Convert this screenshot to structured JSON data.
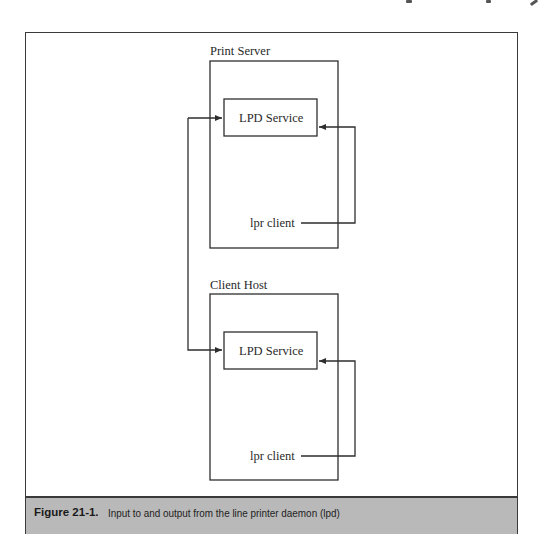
{
  "figure": {
    "number_label": "Figure 21-1.",
    "caption": "Input to and output from the line printer daemon (lpd)"
  },
  "diagram": {
    "hosts": [
      {
        "id": "print-server",
        "label": "Print Server",
        "service_label": "LPD Service",
        "client_label": "lpr client"
      },
      {
        "id": "client-host",
        "label": "Client Host",
        "service_label": "LPD Service",
        "client_label": "lpr client"
      }
    ],
    "colors": {
      "line": "#2e2e2e",
      "caption_background": "#b9b9b9",
      "frame": "#3a3a3a"
    }
  }
}
